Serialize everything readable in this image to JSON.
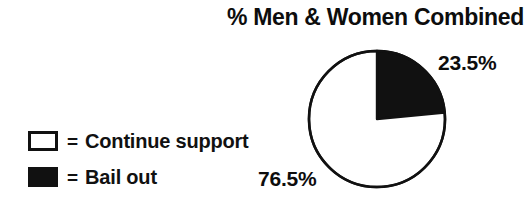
{
  "chart_data": {
    "type": "pie",
    "title": "% Men & Women Combined",
    "categories": [
      "Continue support",
      "Bail out"
    ],
    "values": [
      76.5,
      23.5
    ],
    "value_labels": [
      "76.5%",
      "23.5%"
    ],
    "colors": [
      "#ffffff",
      "#111111"
    ],
    "slice_border_color": "#111111",
    "start_angle_deg": 0,
    "direction": "clockwise",
    "legend_position": "left",
    "grid": false,
    "xlabel": "",
    "ylabel": "",
    "slices": [
      {
        "name": "Bail out",
        "value": 23.5,
        "label": "23.5%",
        "fill": "#111111",
        "swatch": "filled-square-icon"
      },
      {
        "name": "Continue support",
        "value": 76.5,
        "label": "76.5%",
        "fill": "#ffffff",
        "swatch": "hollow-square-icon"
      }
    ]
  },
  "title": "% Men & Women Combined",
  "legend": {
    "equals_sign": "=",
    "items": [
      {
        "swatch": "hollow-square-icon",
        "label": "Continue support"
      },
      {
        "swatch": "filled-square-icon",
        "label": "Bail out"
      }
    ]
  },
  "labels": {
    "bail_out": "23.5%",
    "continue_support": "76.5%"
  },
  "colors": {
    "ink": "#111111",
    "background": "#ffffff"
  }
}
